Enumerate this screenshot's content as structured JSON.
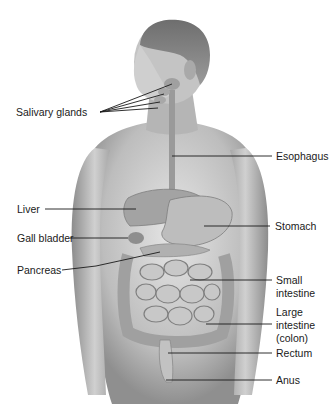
{
  "figure": {
    "colors": {
      "background": "#ffffff",
      "skin_light": "#d9d9d9",
      "skin_dark": "#8a8a8a",
      "organ": "#a6a6a6",
      "line": "#1a1a1a"
    }
  },
  "labels": {
    "salivary_glands": "Salivary glands",
    "esophagus": "Esophagus",
    "liver": "Liver",
    "gall_bladder": "Gall bladder",
    "pancreas": "Pancreas",
    "stomach": "Stomach",
    "small_intestine_1": "Small",
    "small_intestine_2": "intestine",
    "large_intestine_1": "Large",
    "large_intestine_2": "intestine",
    "large_intestine_3": "(colon)",
    "rectum": "Rectum",
    "anus": "Anus"
  }
}
